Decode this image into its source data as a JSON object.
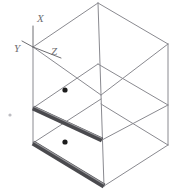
{
  "drawing": {
    "title": "Isometric Box With Two Shelf Rails",
    "type": "3d-wireframe-isometric",
    "background_color": "#ffffff",
    "line_color": "#8a8a90",
    "line_color_dark": "#6e6e72",
    "rail_color": "#4a4a4e",
    "rail_highlight_color": "#9a9a9e",
    "marker_color": "#1c1c1c",
    "faint_mark_color": "#bdbdc2",
    "line_width": 1,
    "canvas": {
      "width": 173,
      "height": 195
    }
  },
  "axes": {
    "origin": {
      "x": 33,
      "y": 47
    },
    "labels": [
      {
        "name": "x-axis-label",
        "text": "X",
        "x": 37,
        "y": 22,
        "tip_x": 33,
        "tip_y": 26
      },
      {
        "name": "y-axis-label",
        "text": "Y",
        "x": 14,
        "y": 52,
        "tip_x": 22,
        "tip_y": 41
      },
      {
        "name": "z-axis-label",
        "text": "Z",
        "x": 51,
        "y": 55,
        "tip_x": 61,
        "tip_y": 58
      }
    ]
  },
  "box": {
    "name": "open-cabinet",
    "vertices": {
      "top_back": {
        "x": 98,
        "y": 3
      },
      "top_left": {
        "x": 33,
        "y": 47
      },
      "top_right": {
        "x": 168,
        "y": 44
      },
      "top_front": {
        "x": 101,
        "y": 95
      },
      "mid_left": {
        "x": 33,
        "y": 108
      },
      "mid_right": {
        "x": 168,
        "y": 105
      },
      "mid_front": {
        "x": 102,
        "y": 140
      },
      "bot_left": {
        "x": 33,
        "y": 143
      },
      "bot_right": {
        "x": 168,
        "y": 145
      },
      "bot_front": {
        "x": 104,
        "y": 186
      }
    },
    "shelves": [
      {
        "name": "upper-shelf-rail",
        "from": {
          "x": 33,
          "y": 108
        },
        "to": {
          "x": 102,
          "y": 140
        },
        "thickness": 5
      },
      {
        "name": "lower-shelf-rail",
        "from": {
          "x": 33,
          "y": 143
        },
        "to": {
          "x": 104,
          "y": 186
        },
        "thickness": 5
      }
    ],
    "markers": [
      {
        "name": "marker-dot-upper",
        "x": 65,
        "y": 90,
        "r": 2.6
      },
      {
        "name": "marker-dot-lower",
        "x": 65,
        "y": 142,
        "r": 2.6
      }
    ],
    "faint_marks": [
      {
        "name": "faint-speck-left",
        "x": 10,
        "y": 115,
        "r": 1.6
      }
    ]
  }
}
